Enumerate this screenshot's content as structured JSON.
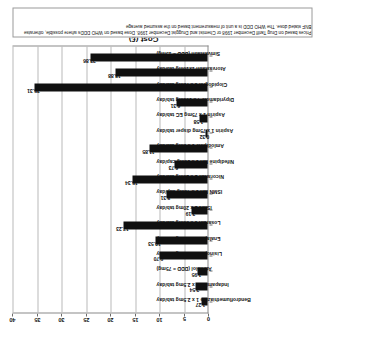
{
  "chart_data": {
    "type": "bar",
    "title": "",
    "xlabel": "",
    "ylabel": "Cost (£)",
    "ylim": [
      0,
      40
    ],
    "yticks": [
      0,
      5,
      10,
      15,
      20,
      25,
      30,
      35,
      40
    ],
    "grid": true,
    "legend": "none",
    "orientation": "rotated-90",
    "bar_color": "#101010",
    "categories": [
      "Bendroflumethiazide 1 x 2.5mg tab/day",
      "Indapamide 1 x 2.5mg tab/day",
      "Atenolol (DDD = 75mg)",
      "Lisinopril 1 x 10mg tab/day",
      "Enalapril 1 x 10mg tab/day",
      "Losartan 1 x 50mg tab/day",
      "ISMN 2 x 20mg tab/day",
      "ISMN MR 1 x 40mg cap/day",
      "Nicorandil 2 x 20mg tab/day",
      "Nifedipine MR 1 x 30mg cap/day",
      "Amlodipine 1 x 5mg tab/day",
      "Aspirin 1 x 75mg disper tab/day",
      "Aspirin 1 x 75mg EC tab/day",
      "Dipyridamole 4 x 100mg tab/day",
      "Clopidogrel 1 x 75mg tab/day",
      "Atorvastatin 1x10mg tab/day",
      "Simvastatin (DDD = 15mg)"
    ],
    "values": [
      1.27,
      2.54,
      1.95,
      9.7,
      10.53,
      17.23,
      3.19,
      8.31,
      15.34,
      6.73,
      11.85,
      0.32,
      1.58,
      6.31,
      35.31,
      18.88,
      23.86
    ],
    "value_labels": [
      "1.27",
      "2.54",
      "1.95",
      "9.70",
      "10.53",
      "17.23",
      "3.19",
      "8.31",
      "15.34",
      "6.73",
      "11.85",
      "0.32",
      "1.58",
      "6.31",
      "35.31",
      "18.88",
      "23.86"
    ]
  },
  "note": {
    "text": "Prices based on Drug Tariff December 1998 or Chemist and Druggist December 1998.  Dose based on WHO DDDs where possible, otherwise BNF stated dose. The WHO DDD is a unit of measurement based on the assumed average"
  }
}
